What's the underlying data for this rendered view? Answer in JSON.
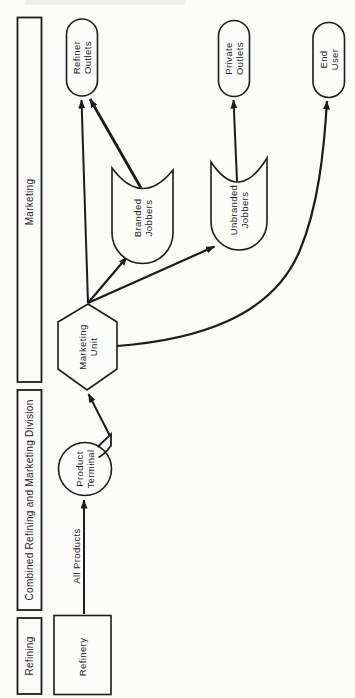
{
  "diagram": {
    "bands": [
      {
        "label": "Marketing"
      },
      {
        "label": "Combined Refining and Marketing Division"
      },
      {
        "label": "Refining"
      }
    ],
    "nodes": {
      "refinery": {
        "label": "Refinery"
      },
      "product_terminal": {
        "line1": "Product",
        "line2": "Terminal"
      },
      "marketing_unit": {
        "line1": "Marketing",
        "line2": "Unit"
      },
      "branded_jobbers": {
        "line1": "Branded",
        "line2": "Jobbers"
      },
      "unbranded_jobbers": {
        "line1": "Unbranded",
        "line2": "Jobbers"
      },
      "refiner_outlets": {
        "line1": "Refiner",
        "line2": "Outlets"
      },
      "private_outlets": {
        "line1": "Private",
        "line2": "Outlets"
      },
      "end_user": {
        "line1": "End",
        "line2": "User"
      }
    },
    "edge_labels": {
      "all_products": "All Products"
    },
    "edges": [
      {
        "from": "Refinery",
        "to": "Product Terminal",
        "label": "All Products"
      },
      {
        "from": "Product Terminal",
        "to": "Marketing Unit"
      },
      {
        "from": "Marketing Unit",
        "to": "Refiner Outlets"
      },
      {
        "from": "Marketing Unit",
        "to": "Branded Jobbers"
      },
      {
        "from": "Marketing Unit",
        "to": "Unbranded Jobbers"
      },
      {
        "from": "Marketing Unit",
        "to": "End User"
      },
      {
        "from": "Branded Jobbers",
        "to": "Refiner Outlets"
      },
      {
        "from": "Unbranded Jobbers",
        "to": "Private Outlets"
      }
    ],
    "colors": {
      "ink": "#1c1c1c",
      "paper": "#fbfbfa"
    }
  }
}
